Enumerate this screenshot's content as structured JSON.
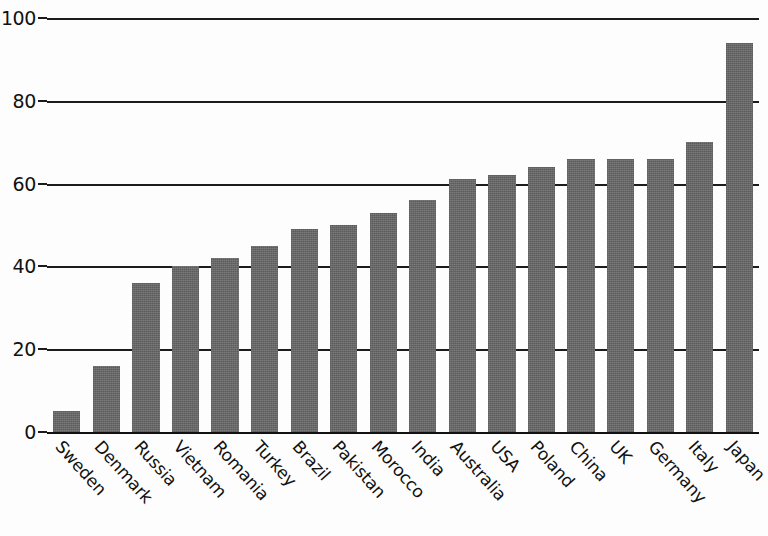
{
  "chart_data": {
    "type": "bar",
    "title": "",
    "xlabel": "",
    "ylabel": "",
    "ylim": [
      0,
      100
    ],
    "yticks": [
      0,
      20,
      40,
      60,
      80,
      100
    ],
    "grid": "horizontal",
    "legend": "none",
    "bar_color": "#6e6e6e",
    "axis_color": "#1c1c1c",
    "categories": [
      "Sweden",
      "Denmark",
      "Russia",
      "Vietnam",
      "Romania",
      "Turkey",
      "Brazil",
      "Pakistan",
      "Morocco",
      "India",
      "Australia",
      "USA",
      "Poland",
      "China",
      "UK",
      "Germany",
      "Italy",
      "Japan"
    ],
    "values": [
      5,
      16,
      36,
      40,
      42,
      45,
      49,
      50,
      53,
      56,
      61,
      62,
      64,
      66,
      66,
      66,
      70,
      94
    ]
  }
}
